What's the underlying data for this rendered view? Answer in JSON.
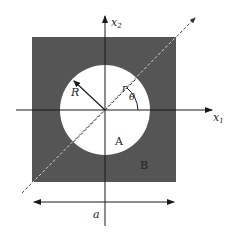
{
  "diagram": {
    "type": "geometry-figure",
    "colors": {
      "background": "#ffffff",
      "matrix_fill": "#555555",
      "inclusion_fill": "#ffffff",
      "line": "#1a1a1a",
      "dashed_line": "#ffffff"
    },
    "labels": {
      "x1_axis": "x",
      "x1_sub": "1",
      "x2_axis": "x",
      "x2_sub": "2",
      "radius": "R",
      "polar_r": "r",
      "angle": "θ",
      "inclusion": "A",
      "matrix": "B",
      "side_length": "a"
    },
    "geometry": {
      "square": {
        "x": 32,
        "y": 37,
        "width": 144,
        "height": 145
      },
      "circle": {
        "cx": 105,
        "cy": 110,
        "r": 45
      },
      "origin": {
        "x": 105,
        "y": 110
      }
    }
  }
}
